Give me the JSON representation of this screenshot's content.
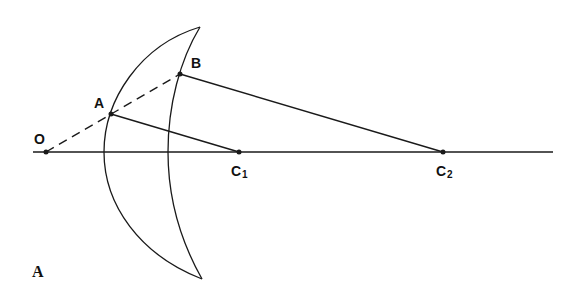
{
  "diagram": {
    "figure_label": "A",
    "stroke_color": "#1a1a1a",
    "points": {
      "O": {
        "label": "O",
        "x": 46,
        "y": 152
      },
      "A": {
        "label": "A",
        "x": 111,
        "y": 114
      },
      "B": {
        "label": "B",
        "x": 180,
        "y": 74
      },
      "C1": {
        "label": "C",
        "sub": "1",
        "x": 239,
        "y": 152
      },
      "C2": {
        "label": "C",
        "sub": "2",
        "x": 443,
        "y": 152
      }
    },
    "axis": {
      "x1": 33,
      "x2": 553,
      "y": 152
    },
    "lens": {
      "top_tip": {
        "x": 200,
        "y": 27
      },
      "bottom_tip": {
        "x": 202,
        "y": 279
      },
      "outer_axis_x": 104,
      "inner_axis_x": 168
    }
  }
}
